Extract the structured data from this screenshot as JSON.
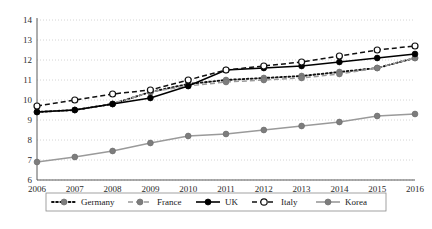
{
  "chart_data": {
    "type": "line",
    "title": "",
    "xlabel": "",
    "ylabel": "",
    "categories": [
      "2006",
      "2007",
      "2008",
      "2009",
      "2010",
      "2011",
      "2012",
      "2013",
      "2014",
      "2015",
      "2016"
    ],
    "x": [
      2006,
      2007,
      2008,
      2009,
      2010,
      2011,
      2012,
      2013,
      2014,
      2015,
      2016
    ],
    "xlim": [
      2006,
      2016
    ],
    "ylim": [
      6,
      14
    ],
    "yticks": [
      6,
      7,
      8,
      9,
      10,
      11,
      12,
      13,
      14
    ],
    "grid": "horizontal-dotted",
    "legend_position": "bottom",
    "series": [
      {
        "name": "Germany",
        "values": [
          9.4,
          9.5,
          9.8,
          10.4,
          10.8,
          11.0,
          11.1,
          11.2,
          11.4,
          11.6,
          12.1
        ],
        "line_style": "dotted",
        "line_color": "#111111",
        "marker": "circle-filled",
        "marker_color": "#7d7d7d"
      },
      {
        "name": "France",
        "values": [
          9.4,
          9.5,
          9.8,
          10.4,
          10.7,
          10.9,
          11.0,
          11.1,
          11.3,
          11.6,
          12.1
        ],
        "line_style": "dashed",
        "line_color": "#9a9a9a",
        "marker": "circle-filled",
        "marker_color": "#7d7d7d"
      },
      {
        "name": "UK",
        "values": [
          9.4,
          9.5,
          9.8,
          10.1,
          10.7,
          11.5,
          11.6,
          11.7,
          11.9,
          12.1,
          12.3
        ],
        "line_style": "solid",
        "line_color": "#000000",
        "marker": "circle-filled",
        "marker_color": "#000000"
      },
      {
        "name": "Italy",
        "values": [
          9.7,
          10.0,
          10.3,
          10.5,
          11.0,
          11.5,
          11.7,
          11.9,
          12.2,
          12.5,
          12.7
        ],
        "line_style": "dashed",
        "line_color": "#111111",
        "marker": "circle-open",
        "marker_color": "#ffffff"
      },
      {
        "name": "Korea",
        "values": [
          6.9,
          7.15,
          7.45,
          7.85,
          8.2,
          8.3,
          8.5,
          8.7,
          8.9,
          9.2,
          9.3
        ],
        "line_style": "solid",
        "line_color": "#9a9a9a",
        "marker": "circle-filled",
        "marker_color": "#7d7d7d"
      }
    ]
  },
  "legend": {
    "items": [
      {
        "label": "Germany"
      },
      {
        "label": "France"
      },
      {
        "label": "UK"
      },
      {
        "label": "Italy"
      },
      {
        "label": "Korea"
      }
    ]
  },
  "colors": {
    "axis": "#5a5a5a",
    "grid": "#c9c9c9",
    "text": "#2b2b2b",
    "black_series": "#000000",
    "gray_series": "#9a9a9a",
    "marker_gray": "#7d7d7d"
  }
}
